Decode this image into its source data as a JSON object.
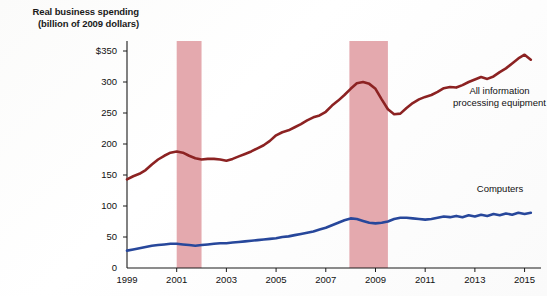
{
  "chart_data": {
    "type": "line",
    "title": "Real business spending",
    "subtitle": "(billion of 2009 dollars)",
    "xlabel": "",
    "ylabel": "Real business spending (billion of 2009 dollars)",
    "xlim": [
      1999,
      2015.5
    ],
    "ylim": [
      0,
      350
    ],
    "yticks": [
      0,
      50,
      100,
      150,
      200,
      250,
      300,
      350
    ],
    "ytick_labels": [
      "0",
      "50",
      "100",
      "150",
      "200",
      "250",
      "300",
      "$350"
    ],
    "xticks": [
      1999,
      2001,
      2003,
      2005,
      2007,
      2009,
      2011,
      2013,
      2015
    ],
    "xtick_labels": [
      "1999",
      "2001",
      "2003",
      "2005",
      "2007",
      "2009",
      "2011",
      "2013",
      "2015"
    ],
    "grid": false,
    "legend_position": "inline-right",
    "colors": {
      "all_information_processing_equipment": "#8c2222",
      "computers": "#27479b",
      "recession_band": "#e4a9ae",
      "axis": "#1a1a1a"
    },
    "annotations": [
      {
        "name": "recession-band-2001",
        "type": "vspan",
        "x0": 2001.0,
        "x1": 2002.0,
        "label": "recession"
      },
      {
        "name": "recession-band-2008",
        "type": "vspan",
        "x0": 2007.95,
        "x1": 2009.5,
        "label": "recession"
      }
    ],
    "series": [
      {
        "name": "All information processing equipment",
        "color": "#8c2222",
        "label_text": "All information\nprocessing equipment",
        "x": [
          1999.0,
          1999.25,
          1999.5,
          1999.75,
          2000.0,
          2000.25,
          2000.5,
          2000.75,
          2001.0,
          2001.25,
          2001.5,
          2001.75,
          2002.0,
          2002.25,
          2002.5,
          2002.75,
          2003.0,
          2003.25,
          2003.5,
          2003.75,
          2004.0,
          2004.25,
          2004.5,
          2004.75,
          2005.0,
          2005.25,
          2005.5,
          2005.75,
          2006.0,
          2006.25,
          2006.5,
          2006.75,
          2007.0,
          2007.25,
          2007.5,
          2007.75,
          2008.0,
          2008.25,
          2008.5,
          2008.75,
          2009.0,
          2009.25,
          2009.5,
          2009.75,
          2010.0,
          2010.25,
          2010.5,
          2010.75,
          2011.0,
          2011.25,
          2011.5,
          2011.75,
          2012.0,
          2012.25,
          2012.5,
          2012.75,
          2013.0,
          2013.25,
          2013.5,
          2013.75,
          2014.0,
          2014.25,
          2014.5,
          2014.75,
          2015.0,
          2015.25
        ],
        "values": [
          143,
          148,
          152,
          158,
          167,
          175,
          181,
          186,
          188,
          186,
          181,
          177,
          175,
          176,
          176,
          175,
          173,
          176,
          180,
          184,
          188,
          193,
          198,
          205,
          214,
          219,
          222,
          227,
          232,
          238,
          243,
          246,
          252,
          262,
          270,
          279,
          289,
          298,
          300,
          297,
          289,
          272,
          256,
          248,
          249,
          258,
          266,
          272,
          276,
          279,
          284,
          290,
          292,
          291,
          295,
          300,
          304,
          308,
          305,
          309,
          316,
          322,
          330,
          338,
          344,
          336
        ]
      },
      {
        "name": "Computers",
        "color": "#27479b",
        "label_text": "Computers",
        "x": [
          1999.0,
          1999.25,
          1999.5,
          1999.75,
          2000.0,
          2000.25,
          2000.5,
          2000.75,
          2001.0,
          2001.25,
          2001.5,
          2001.75,
          2002.0,
          2002.25,
          2002.5,
          2002.75,
          2003.0,
          2003.25,
          2003.5,
          2003.75,
          2004.0,
          2004.25,
          2004.5,
          2004.75,
          2005.0,
          2005.25,
          2005.5,
          2005.75,
          2006.0,
          2006.25,
          2006.5,
          2006.75,
          2007.0,
          2007.25,
          2007.5,
          2007.75,
          2008.0,
          2008.25,
          2008.5,
          2008.75,
          2009.0,
          2009.25,
          2009.5,
          2009.75,
          2010.0,
          2010.25,
          2010.5,
          2010.75,
          2011.0,
          2011.25,
          2011.5,
          2011.75,
          2012.0,
          2012.25,
          2012.5,
          2012.75,
          2013.0,
          2013.25,
          2013.5,
          2013.75,
          2014.0,
          2014.25,
          2014.5,
          2014.75,
          2015.0,
          2015.25
        ],
        "values": [
          28,
          30,
          32,
          34,
          36,
          37,
          38,
          39,
          39,
          38,
          37,
          36,
          37,
          38,
          39,
          40,
          40,
          41,
          42,
          43,
          44,
          45,
          46,
          47,
          48,
          50,
          51,
          53,
          55,
          57,
          59,
          62,
          65,
          69,
          73,
          77,
          80,
          79,
          76,
          73,
          72,
          73,
          75,
          79,
          81,
          81,
          80,
          79,
          78,
          79,
          81,
          83,
          82,
          84,
          82,
          85,
          83,
          86,
          84,
          87,
          85,
          88,
          86,
          89,
          87,
          89
        ]
      }
    ]
  },
  "labels": {
    "title_line1": "Real business spending",
    "title_line2": "(billion of 2009 dollars)",
    "series_all_info_line1": "All information",
    "series_all_info_line2": "processing equipment",
    "series_computers": "Computers"
  }
}
